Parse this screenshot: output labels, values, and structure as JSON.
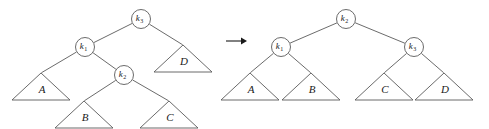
{
  "figure": {
    "kind": "binary-tree-rotation-diagram",
    "background_color": "#ffffff",
    "stroke_color": "#5a5a5a",
    "text_color": "#1a1a1a"
  },
  "arrow": {
    "glyph": "→",
    "name": "transforms-into-arrow"
  },
  "left_tree": {
    "name": "before-rotation-tree",
    "nodes": [
      {
        "id": "n-k3",
        "base": "k",
        "sub": "3",
        "label": "k3",
        "cx": 141,
        "cy": 19,
        "r": 9.5
      },
      {
        "id": "n-k1",
        "base": "k",
        "sub": "1",
        "label": "k1",
        "cx": 85,
        "cy": 47,
        "r": 9.5
      },
      {
        "id": "n-k2",
        "base": "k",
        "sub": "2",
        "label": "k2",
        "cx": 124,
        "cy": 75,
        "r": 9.5
      }
    ],
    "subtrees": [
      {
        "id": "t-A",
        "label": "A",
        "apex_x": 41,
        "apex_y": 73,
        "half_width": 29,
        "height": 27
      },
      {
        "id": "t-B",
        "label": "B",
        "apex_x": 84,
        "apex_y": 101,
        "half_width": 29,
        "height": 27
      },
      {
        "id": "t-C",
        "label": "C",
        "apex_x": 169,
        "apex_y": 101,
        "half_width": 29,
        "height": 27
      },
      {
        "id": "t-D",
        "label": "D",
        "apex_x": 183,
        "apex_y": 45,
        "half_width": 29,
        "height": 27
      }
    ],
    "edges": [
      {
        "from": "n-k3",
        "to": "n-k1"
      },
      {
        "from": "n-k3",
        "to": "t-D"
      },
      {
        "from": "n-k1",
        "to": "t-A"
      },
      {
        "from": "n-k1",
        "to": "n-k2"
      },
      {
        "from": "n-k2",
        "to": "t-B"
      },
      {
        "from": "n-k2",
        "to": "t-C"
      }
    ]
  },
  "right_tree": {
    "name": "after-rotation-tree",
    "nodes": [
      {
        "id": "r-k2",
        "base": "k",
        "sub": "2",
        "label": "k2",
        "cx": 346,
        "cy": 19,
        "r": 9.5
      },
      {
        "id": "r-k1",
        "base": "k",
        "sub": "1",
        "label": "k1",
        "cx": 281,
        "cy": 47,
        "r": 9.5
      },
      {
        "id": "r-k3",
        "base": "k",
        "sub": "3",
        "label": "k3",
        "cx": 414,
        "cy": 47,
        "r": 9.5
      }
    ],
    "subtrees": [
      {
        "id": "r-A",
        "label": "A",
        "apex_x": 250,
        "apex_y": 73,
        "half_width": 29,
        "height": 27
      },
      {
        "id": "r-B",
        "label": "B",
        "apex_x": 311,
        "apex_y": 73,
        "half_width": 29,
        "height": 27
      },
      {
        "id": "r-C",
        "label": "C",
        "apex_x": 384,
        "apex_y": 73,
        "half_width": 29,
        "height": 27
      },
      {
        "id": "r-D",
        "label": "D",
        "apex_x": 444,
        "apex_y": 73,
        "half_width": 29,
        "height": 27
      }
    ],
    "edges": [
      {
        "from": "r-k2",
        "to": "r-k1"
      },
      {
        "from": "r-k2",
        "to": "r-k3"
      },
      {
        "from": "r-k1",
        "to": "r-A"
      },
      {
        "from": "r-k1",
        "to": "r-B"
      },
      {
        "from": "r-k3",
        "to": "r-C"
      },
      {
        "from": "r-k3",
        "to": "r-D"
      }
    ]
  }
}
